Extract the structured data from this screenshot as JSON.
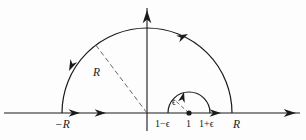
{
  "figure": {
    "type": "contour-integration-diagram",
    "colors": {
      "stroke": "#1a1a1a",
      "background": "#fdfdfd",
      "dashed": "#555555"
    }
  },
  "axes": {
    "horizontal": {
      "name": "real-axis",
      "y": 113,
      "x_start": 4,
      "x_end": 300,
      "arrow_at_right": true,
      "arrow_at_left": false
    },
    "vertical": {
      "name": "imaginary-axis",
      "x": 147,
      "y_top": 8,
      "y_bottom": 131,
      "arrow_at_top": true
    }
  },
  "big_arc": {
    "name": "outer-semicircle",
    "center_x": 147,
    "center_y": 113,
    "radius": 85,
    "direction": "counterclockwise",
    "radius_label": "R",
    "radius_line_angle_deg": 127
  },
  "small_arc": {
    "name": "inner-semicircle",
    "center_x": 189,
    "center_y": 113,
    "radius": 21,
    "direction": "counterclockwise",
    "radius_label": "ϵ",
    "radius_line_angle_deg": 138
  },
  "points": [
    {
      "name": "pole-point",
      "x": 189,
      "y": 113,
      "marker": "filled-dot"
    }
  ],
  "labels": [
    {
      "name": "label-minus-R",
      "text": "−R",
      "x": 55,
      "y": 119,
      "style": "lbl-size-main lbl-italic"
    },
    {
      "name": "label-R-radius",
      "text": "R",
      "x": 93,
      "y": 67,
      "style": "lbl-size-main lbl-italic"
    },
    {
      "name": "label-epsilon",
      "text": "ϵ",
      "x": 172,
      "y": 98,
      "style": "lbl-size-eps"
    },
    {
      "name": "label-one-minus-eps",
      "text": "1−ϵ",
      "x": 155,
      "y": 119,
      "style": "lbl-size-small"
    },
    {
      "name": "label-one",
      "text": "1",
      "x": 186,
      "y": 119,
      "style": "lbl-size-small"
    },
    {
      "name": "label-one-plus-eps",
      "text": "1+ϵ",
      "x": 199,
      "y": 119,
      "style": "lbl-size-small"
    },
    {
      "name": "label-R-right",
      "text": "R",
      "x": 233,
      "y": 119,
      "style": "lbl-size-main lbl-italic"
    }
  ],
  "arrowheads": [
    {
      "name": "arrowhead-real-axis-right",
      "x": 296,
      "y": 113,
      "angle_deg": 0,
      "size": 6.5
    },
    {
      "name": "arrowhead-imag-axis-top",
      "x": 147,
      "y": 10,
      "angle_deg": -90,
      "size": 7
    },
    {
      "name": "arrowhead-segment-left-1",
      "x": 80,
      "y": 113,
      "angle_deg": 0,
      "size": 6
    },
    {
      "name": "arrowhead-segment-left-2",
      "x": 106,
      "y": 113,
      "angle_deg": 0,
      "size": 6
    },
    {
      "name": "arrowhead-segment-right-1",
      "x": 221,
      "y": 113,
      "angle_deg": 0,
      "size": 6
    },
    {
      "name": "arrowhead-outer-arc-left",
      "x": 69,
      "y": 71,
      "angle_deg": 115,
      "size": 6
    },
    {
      "name": "arrowhead-outer-arc-right",
      "x": 188,
      "y": 34,
      "angle_deg": -26,
      "size": 6
    },
    {
      "name": "arrowhead-inner-arc-top",
      "x": 184,
      "y": 92,
      "angle_deg": -76,
      "size": 5.5
    }
  ]
}
